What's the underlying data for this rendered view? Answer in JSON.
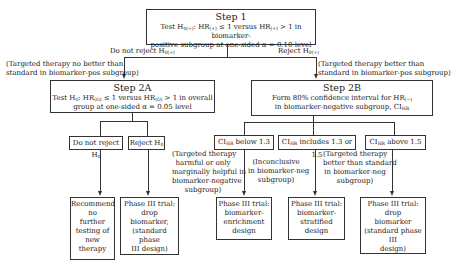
{
  "step1": {
    "title": "Step 1",
    "line1_a": "Test H",
    "line1_sub1": "0(+)",
    "line1_b": ": HR",
    "line1_sub2": "(+)",
    "line1_c": " ≤ 1 versus HR",
    "line1_sub3": "(+)",
    "line1_d": " > 1 in biomarker-",
    "line2": "positive subgroup at one-sided α = 0.10 level"
  },
  "branch_left": {
    "label_a": "Do not reject H",
    "label_sub": "0(+)",
    "note_line1": "(Targeted therapy no better than",
    "note_line2": "standard in biomarker-pos subgroup)"
  },
  "branch_right": {
    "label_a": "Reject H",
    "label_sub": "0(+)",
    "note_line1": "(Targeted therapy better than",
    "note_line2": "standard in biomarker-pos subgroup)"
  },
  "step2a": {
    "title": "Step 2A",
    "line1_a": "Test H",
    "line1_sub1": "0",
    "line1_b": ": HR",
    "line1_sub2": "(O)",
    "line1_c": " ≤ 1 versus HR",
    "line1_sub3": "(O)",
    "line1_d": " > 1 in overall",
    "line2": "group at one-sided α = 0.05 level"
  },
  "step2b": {
    "title": "Step 2B",
    "line1_a": "Form 80% confidence interval for HR",
    "line1_sub": "(−)",
    "line2_a": "in biomarker-negative subgroup, CI",
    "line2_sub": "HR"
  },
  "decisions_2a": [
    {
      "label_a": "Do not reject H",
      "label_sub": "0"
    },
    {
      "label_a": "Reject H",
      "label_sub": "0"
    }
  ],
  "decisions_2b": [
    {
      "label_a": "CI",
      "label_sub": "HR",
      "label_b": " below 1.3",
      "note": [
        "(Targeted therapy",
        "harmful or only",
        "marginally helpful in",
        "biomarker-negative",
        "subgroup)"
      ]
    },
    {
      "label_a": "CI",
      "label_sub": "HR",
      "label_b": " includes 1.3 or 1.5",
      "note": [
        "(Inconclusive",
        "in biomarker-neg",
        "subgroup)"
      ]
    },
    {
      "label_a": "CI",
      "label_sub": "HR",
      "label_b": " above 1.5",
      "note": [
        "(Targeted therapy",
        "better than standard",
        "in biomarker-neg",
        "subgroup)"
      ]
    }
  ],
  "outcomes": [
    {
      "lines": [
        "Recommend",
        "no",
        "further",
        "testing of",
        "new",
        "therapy"
      ]
    },
    {
      "lines": [
        "Phase III trial:",
        "drop",
        "biomarker,",
        "(standard phase",
        "III design)"
      ]
    },
    {
      "lines": [
        "Phase III trial:",
        "biomarker-",
        "enrichment",
        "design"
      ]
    },
    {
      "lines": [
        "Phase III trial:",
        "biomarker-",
        "stratified",
        "design"
      ]
    },
    {
      "lines": [
        "Phase III trial:",
        "drop",
        "biomarker",
        "(standard phase III",
        "design)"
      ]
    }
  ]
}
